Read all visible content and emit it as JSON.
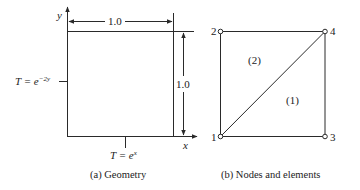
{
  "panel_a": {
    "caption": "(a)  Geometry",
    "axis_x_label": "x",
    "axis_y_label": "y",
    "width_dimension": "1.0",
    "height_dimension": "1.0",
    "left_bc": {
      "prefix": "T = e",
      "exponent": "−2y"
    },
    "bottom_bc": {
      "prefix": "T = e",
      "exponent": "x"
    }
  },
  "panel_b": {
    "caption": "(b)  Nodes and elements",
    "nodes": [
      {
        "id": "1",
        "x": 0,
        "y": 0
      },
      {
        "id": "2",
        "x": 0,
        "y": 1
      },
      {
        "id": "3",
        "x": 1,
        "y": 0
      },
      {
        "id": "4",
        "x": 1,
        "y": 1
      }
    ],
    "elements": [
      {
        "label": "(1)",
        "nodes": [
          "1",
          "3",
          "4"
        ]
      },
      {
        "label": "(2)",
        "nodes": [
          "1",
          "4",
          "2"
        ]
      }
    ]
  },
  "colors": {
    "line": "#2a2a2a",
    "background": "#ffffff"
  }
}
